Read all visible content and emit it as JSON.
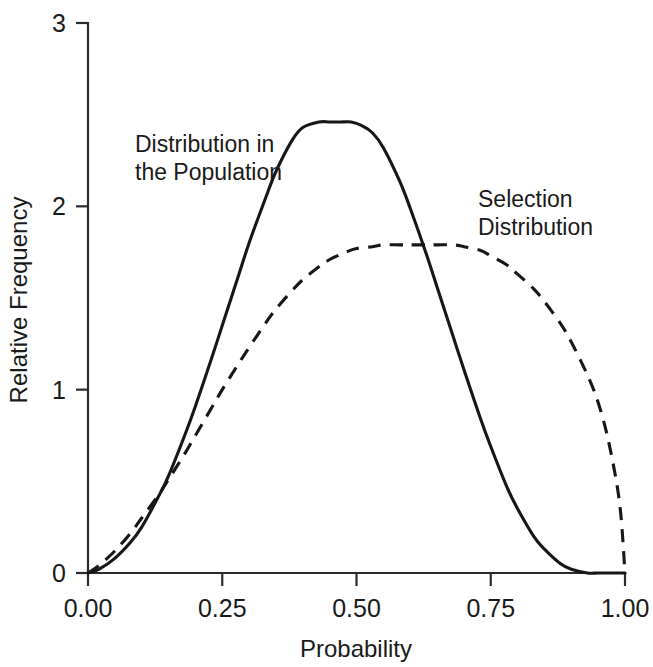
{
  "chart_data": {
    "type": "line",
    "title": "",
    "xlabel": "Probability",
    "ylabel": "Relative Frequency",
    "xlim": [
      0,
      1
    ],
    "ylim": [
      0,
      3
    ],
    "xticks": [
      0,
      0.25,
      0.5,
      0.75,
      1
    ],
    "xticklabels": [
      "0.00",
      "0.25",
      "0.50",
      "0.75",
      "1.00"
    ],
    "yticks": [
      0,
      1,
      2,
      3
    ],
    "yticklabels": [
      "0",
      "1",
      "2",
      "3"
    ],
    "grid": false,
    "legend_position": "inline-annotations",
    "series": [
      {
        "name": "Distribution in the Population",
        "style": "solid",
        "color": "#171717",
        "annotation": "Distribution in\nthe Population",
        "annotation_lines": [
          "Distribution in",
          "the Population"
        ],
        "peak_x": 0.49,
        "peak_y": 2.46,
        "x": [
          0.0,
          0.02,
          0.05,
          0.08,
          0.1,
          0.13,
          0.15,
          0.18,
          0.2,
          0.23,
          0.25,
          0.28,
          0.3,
          0.33,
          0.35,
          0.38,
          0.4,
          0.43,
          0.45,
          0.47,
          0.49,
          0.51,
          0.53,
          0.55,
          0.58,
          0.6,
          0.63,
          0.65,
          0.68,
          0.7,
          0.73,
          0.75,
          0.78,
          0.8,
          0.83,
          0.85,
          0.88,
          0.9,
          0.93,
          0.95,
          0.97,
          1.0
        ],
        "y": [
          0.0,
          0.02,
          0.08,
          0.17,
          0.25,
          0.41,
          0.53,
          0.75,
          0.91,
          1.17,
          1.35,
          1.62,
          1.8,
          2.04,
          2.19,
          2.36,
          2.43,
          2.46,
          2.46,
          2.46,
          2.46,
          2.44,
          2.4,
          2.32,
          2.14,
          1.99,
          1.74,
          1.56,
          1.29,
          1.11,
          0.85,
          0.69,
          0.47,
          0.35,
          0.2,
          0.13,
          0.05,
          0.02,
          0.0,
          0.0,
          0.0,
          0.0
        ]
      },
      {
        "name": "Selection Distribution",
        "style": "dashed",
        "color": "#171717",
        "annotation": "Selection\nDistribution",
        "annotation_lines": [
          "Selection",
          "Distribution"
        ],
        "peak_x": 0.68,
        "peak_y": 1.79,
        "x": [
          0.0,
          0.02,
          0.05,
          0.08,
          0.1,
          0.13,
          0.15,
          0.18,
          0.2,
          0.23,
          0.25,
          0.28,
          0.3,
          0.33,
          0.35,
          0.38,
          0.4,
          0.43,
          0.45,
          0.48,
          0.5,
          0.53,
          0.55,
          0.58,
          0.6,
          0.63,
          0.65,
          0.68,
          0.7,
          0.73,
          0.75,
          0.78,
          0.8,
          0.83,
          0.85,
          0.88,
          0.9,
          0.93,
          0.95,
          0.97,
          0.99,
          1.0
        ],
        "y": [
          0.0,
          0.04,
          0.12,
          0.22,
          0.3,
          0.42,
          0.51,
          0.65,
          0.75,
          0.9,
          1.0,
          1.14,
          1.23,
          1.36,
          1.44,
          1.54,
          1.6,
          1.67,
          1.71,
          1.75,
          1.77,
          1.78,
          1.79,
          1.79,
          1.79,
          1.79,
          1.79,
          1.79,
          1.78,
          1.76,
          1.73,
          1.68,
          1.63,
          1.55,
          1.48,
          1.36,
          1.26,
          1.08,
          0.93,
          0.71,
          0.38,
          0.0
        ]
      }
    ],
    "crossing_point": {
      "x": 0.63,
      "y": 1.77
    },
    "annotations": [
      {
        "id": "population-annotation",
        "lines": [
          "Distribution in",
          "the Population"
        ],
        "x_px": 135,
        "y_px": 152
      },
      {
        "id": "selection-annotation",
        "lines": [
          "Selection",
          "Distribution"
        ],
        "x_px": 478,
        "y_px": 207
      }
    ]
  },
  "axes": {
    "x_title": "Probability",
    "y_title": "Relative Frequency"
  }
}
